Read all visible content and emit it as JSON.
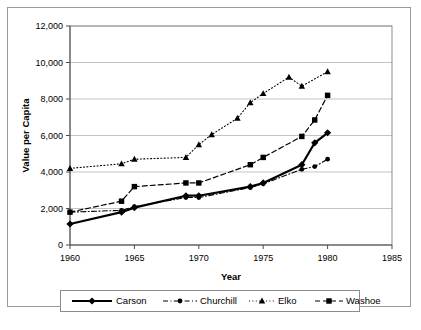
{
  "chart_data": {
    "type": "line",
    "title": "",
    "xlabel": "Year",
    "ylabel": "Value per Capita",
    "xlim": [
      1960,
      1985
    ],
    "ylim": [
      0,
      12000
    ],
    "xticks": [
      "1960",
      "1965",
      "1970",
      "1975",
      "1980",
      "1985"
    ],
    "xtick_values": [
      1960,
      1965,
      1970,
      1975,
      1980,
      1985
    ],
    "yticks": [
      "0",
      "2,000",
      "4,000",
      "6,000",
      "8,000",
      "10,000",
      "12,000"
    ],
    "ytick_values": [
      0,
      2000,
      4000,
      6000,
      8000,
      10000,
      12000
    ],
    "grid": "horizontal",
    "legend_position": "bottom",
    "series": [
      {
        "name": "Carson",
        "marker": "diamond",
        "line_style": "solid",
        "line_width": 2.2,
        "color": "#000000",
        "points": [
          {
            "x": 1960,
            "y": 1150
          },
          {
            "x": 1964,
            "y": 1800
          },
          {
            "x": 1965,
            "y": 2050
          },
          {
            "x": 1969,
            "y": 2700
          },
          {
            "x": 1970,
            "y": 2700
          },
          {
            "x": 1974,
            "y": 3200
          },
          {
            "x": 1975,
            "y": 3400
          },
          {
            "x": 1978,
            "y": 4400
          },
          {
            "x": 1979,
            "y": 5600
          },
          {
            "x": 1980,
            "y": 6150
          }
        ]
      },
      {
        "name": "Churchill",
        "marker": "circle",
        "line_style": "dashdot",
        "line_width": 1.1,
        "color": "#000000",
        "points": [
          {
            "x": 1960,
            "y": 1800
          },
          {
            "x": 1964,
            "y": 1900
          },
          {
            "x": 1965,
            "y": 2100
          },
          {
            "x": 1969,
            "y": 2600
          },
          {
            "x": 1970,
            "y": 2600
          },
          {
            "x": 1974,
            "y": 3150
          },
          {
            "x": 1975,
            "y": 3350
          },
          {
            "x": 1978,
            "y": 4150
          },
          {
            "x": 1979,
            "y": 4300
          },
          {
            "x": 1980,
            "y": 4700
          }
        ]
      },
      {
        "name": "Elko",
        "marker": "triangle",
        "line_style": "dotted",
        "line_width": 1.1,
        "color": "#000000",
        "points": [
          {
            "x": 1960,
            "y": 4200
          },
          {
            "x": 1964,
            "y": 4450
          },
          {
            "x": 1965,
            "y": 4700
          },
          {
            "x": 1969,
            "y": 4800
          },
          {
            "x": 1970,
            "y": 5500
          },
          {
            "x": 1971,
            "y": 6050
          },
          {
            "x": 1973,
            "y": 6950
          },
          {
            "x": 1974,
            "y": 7800
          },
          {
            "x": 1975,
            "y": 8300
          },
          {
            "x": 1977,
            "y": 9200
          },
          {
            "x": 1978,
            "y": 8700
          },
          {
            "x": 1980,
            "y": 9500
          }
        ]
      },
      {
        "name": "Washoe",
        "marker": "square",
        "line_style": "dashed",
        "line_width": 1.2,
        "color": "#000000",
        "points": [
          {
            "x": 1960,
            "y": 1800
          },
          {
            "x": 1964,
            "y": 2400
          },
          {
            "x": 1965,
            "y": 3200
          },
          {
            "x": 1969,
            "y": 3400
          },
          {
            "x": 1970,
            "y": 3400
          },
          {
            "x": 1974,
            "y": 4400
          },
          {
            "x": 1975,
            "y": 4800
          },
          {
            "x": 1978,
            "y": 5950
          },
          {
            "x": 1979,
            "y": 6850
          },
          {
            "x": 1980,
            "y": 8200
          }
        ]
      }
    ]
  },
  "legend": {
    "entries": [
      {
        "label": "Carson",
        "marker": "diamond",
        "line_style": "solid"
      },
      {
        "label": "Churchill",
        "marker": "circle",
        "line_style": "dashdot"
      },
      {
        "label": "Elko",
        "marker": "triangle",
        "line_style": "dotted"
      },
      {
        "label": "Washoe",
        "marker": "square",
        "line_style": "dashed"
      }
    ]
  },
  "colors": {
    "ink": "#000000",
    "grid": "#b4b4b4",
    "frame": "#9a9a9a",
    "background": "#ffffff"
  }
}
